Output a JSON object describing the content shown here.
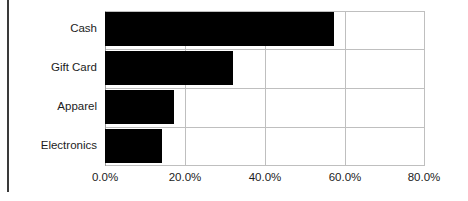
{
  "chart_data": {
    "type": "bar",
    "orientation": "horizontal",
    "title": "",
    "subtitle": "",
    "xlabel": "",
    "ylabel": "",
    "categories": [
      "Cash",
      "Gift Card",
      "Apparel",
      "Electronics"
    ],
    "values": [
      57.3,
      32.0,
      17.3,
      14.2
    ],
    "value_format": "percent",
    "xlim": [
      0,
      80
    ],
    "xticks": [
      0,
      20,
      40,
      60,
      80
    ],
    "xtick_labels": [
      "0.0%",
      "20.0%",
      "40.0%",
      "60.0%",
      "80.0%"
    ],
    "grid": true,
    "grid_axis": "both",
    "legend": false,
    "legend_position": "none",
    "series": [
      {
        "name": "Share",
        "color": "#000000",
        "values": [
          57.3,
          32.0,
          17.3,
          14.2
        ]
      }
    ],
    "annotations": []
  },
  "colors": {
    "bar": "#000000",
    "grid": "#bfbfbf",
    "axis": "#9a9a9a",
    "text": "#1c1c1c",
    "background": "#ffffff",
    "page_rule": "#3a3a3a"
  }
}
